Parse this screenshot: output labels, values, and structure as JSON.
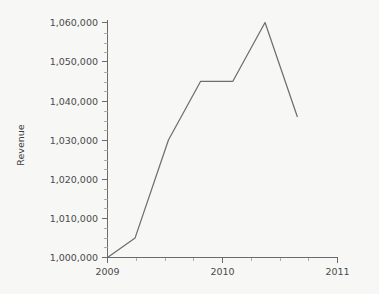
{
  "chart_data": {
    "type": "line",
    "title": "",
    "subtitle": "",
    "xlabel": "",
    "ylabel": "Revenue",
    "xlim": [
      2009,
      2011
    ],
    "ylim": [
      1000000,
      1060000
    ],
    "grid": false,
    "legend": null,
    "legend_position": "none",
    "x_tick_labels": [
      "2009",
      "2010",
      "2011"
    ],
    "x_ticks": [
      2009,
      2010,
      2011
    ],
    "x_minor_tick_interval": 0.25,
    "y_tick_labels": [
      "1,000,000",
      "1,010,000",
      "1,020,000",
      "1,030,000",
      "1,040,000",
      "1,050,000",
      "1,060,000"
    ],
    "y_ticks": [
      1000000,
      1010000,
      1020000,
      1030000,
      1040000,
      1050000,
      1060000
    ],
    "y_minor_tick_interval": 2500,
    "series": [
      {
        "name": "Revenue",
        "color": "#6e6e6e",
        "x": [
          2009.0,
          2009.24,
          2009.53,
          2009.81,
          2010.09,
          2010.37,
          2010.65
        ],
        "values": [
          1000000,
          1005000,
          1030000,
          1045000,
          1045000,
          1060000,
          1036000
        ]
      }
    ],
    "annotations": []
  },
  "colors": {
    "background": "#f7f7f6",
    "axis": "#6b6b6b",
    "tick_minor": "#9a9a9a",
    "line": "#6e6e6e",
    "text": "#3d3d3d"
  }
}
